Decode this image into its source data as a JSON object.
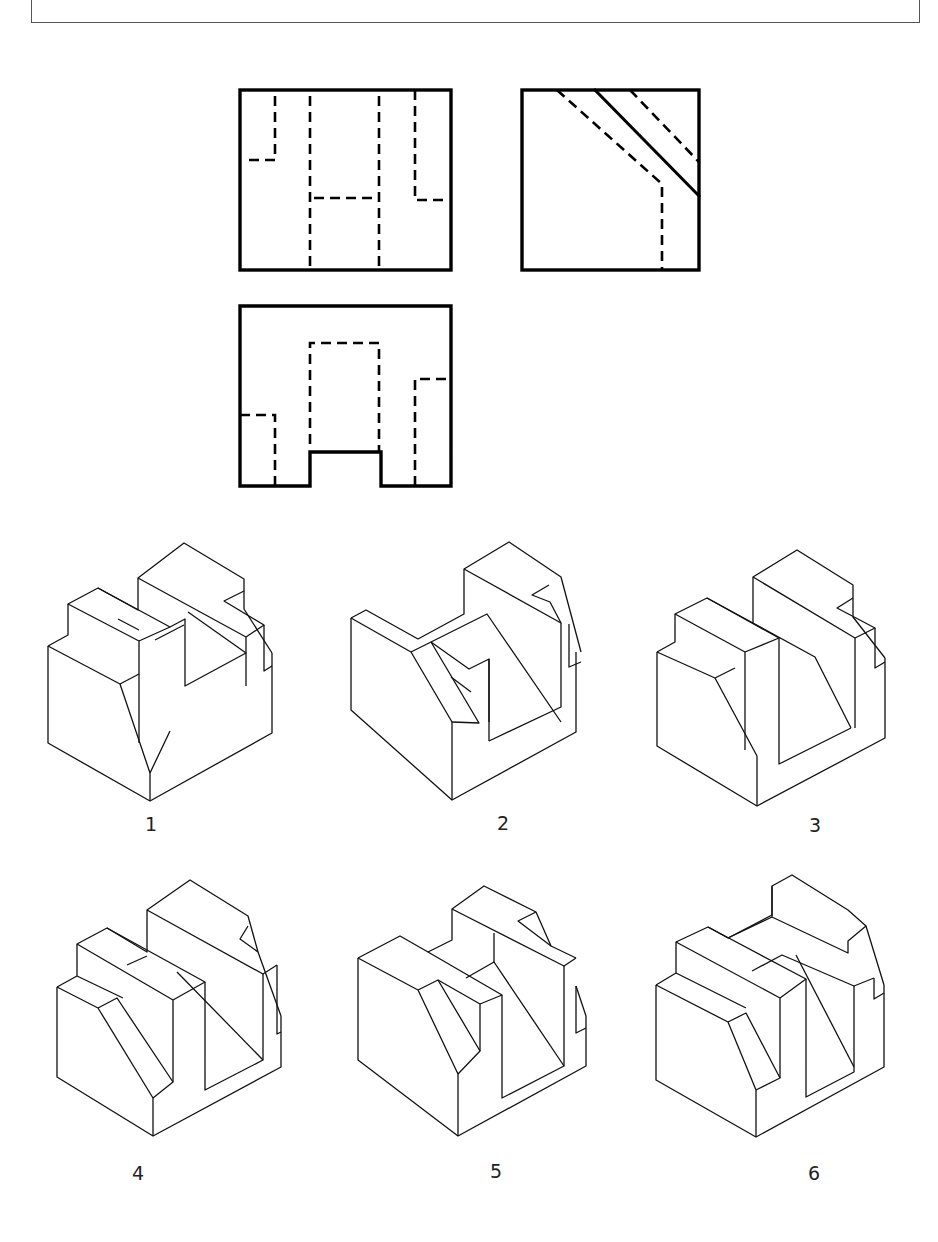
{
  "header": {
    "frame": "question-box"
  },
  "views": {
    "front": {
      "name": "front-view"
    },
    "side": {
      "name": "side-view"
    },
    "plan": {
      "name": "plan-view"
    }
  },
  "options": [
    {
      "label": "1"
    },
    {
      "label": "2"
    },
    {
      "label": "3"
    },
    {
      "label": "4"
    },
    {
      "label": "5"
    },
    {
      "label": "6"
    }
  ],
  "colors": {
    "line": "#000000",
    "background": "#ffffff",
    "frame": "#555555"
  }
}
